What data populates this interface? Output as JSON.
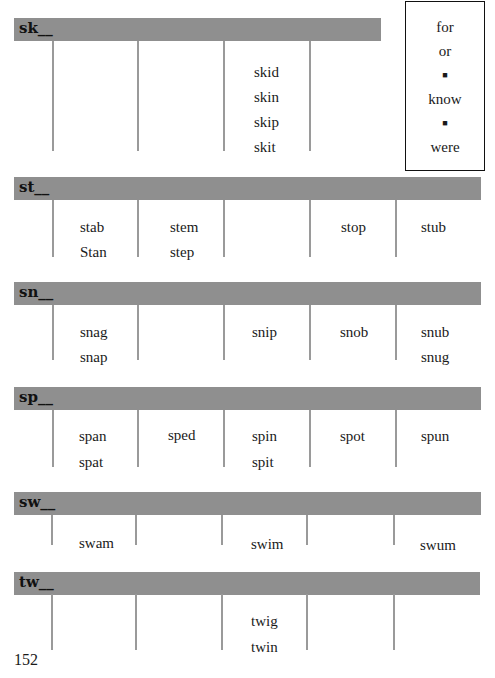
{
  "sight_words": {
    "items": [
      "for",
      "or",
      "■",
      "know",
      "■",
      "were"
    ],
    "kinds": [
      "word",
      "word",
      "separator",
      "word",
      "separator",
      "word"
    ]
  },
  "sections": [
    {
      "label": "sk__",
      "columns": [
        [],
        [],
        [],
        [
          "skid",
          "skin",
          "skip",
          "skit"
        ],
        []
      ]
    },
    {
      "label": "st__",
      "columns": [
        [
          "stab",
          "Stan"
        ],
        [
          "stem",
          "step"
        ],
        [],
        [
          "stop"
        ],
        [
          "stub"
        ]
      ]
    },
    {
      "label": "sn__",
      "columns": [
        [
          "snag",
          "snap"
        ],
        [],
        [
          "snip"
        ],
        [
          "snob"
        ],
        [
          "snub",
          "snug"
        ]
      ]
    },
    {
      "label": "sp__",
      "columns": [
        [
          "span",
          "spat"
        ],
        [
          "sped"
        ],
        [
          "spin",
          "spit"
        ],
        [
          "spot"
        ],
        [
          "spun"
        ]
      ]
    },
    {
      "label": "sw__",
      "columns": [
        [
          "swam"
        ],
        [],
        [
          "swim"
        ],
        [],
        [
          "swum"
        ]
      ]
    },
    {
      "label": "tw__",
      "columns": [
        [],
        [],
        [
          "twig",
          "twin"
        ],
        [],
        []
      ]
    }
  ],
  "page_number": "152",
  "colors": {
    "band": "#8f8f8f",
    "divider": "#9a9a9a",
    "text": "#1a1a1a"
  }
}
